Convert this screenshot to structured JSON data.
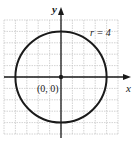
{
  "figure": {
    "x_axis_label": "x",
    "y_axis_label": "y",
    "center_label": "(0, 0)",
    "radius_label": "r = 4",
    "grid_min": -5,
    "grid_max": 5,
    "grid_step": 1
  },
  "chart_data": {
    "type": "diagram",
    "shape": "circle",
    "center": [
      0,
      0
    ],
    "radius": 4,
    "xlabel": "x",
    "ylabel": "y",
    "xlim": [
      -5,
      5
    ],
    "ylim": [
      -5,
      5
    ],
    "grid": true,
    "annotations": [
      {
        "text": "(0, 0)",
        "at": [
          0,
          0
        ]
      },
      {
        "text": "r = 4",
        "at": [
          3.4,
          3.8
        ]
      }
    ]
  },
  "colors": {
    "grid": "#c8c8c8",
    "axis": "#1a1a1a",
    "circle": "#1a1a1a",
    "background": "#ffffff"
  }
}
